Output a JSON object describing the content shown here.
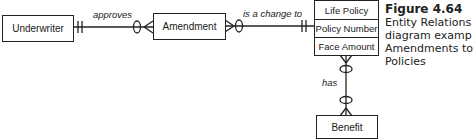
{
  "entities": {
    "underwriter": "Underwriter",
    "amendment": "Amendment",
    "life_policy": {
      "rows": [
        "Life Policy",
        "Policy Number",
        "Face Amount"
      ]
    },
    "benefit": "Benefit"
  },
  "relationships": {
    "approves": "approves",
    "is_a_change_to": "is a change to",
    "has": "has"
  },
  "caption": {
    "title": "Figure 4.64",
    "lines": [
      "Entity Relations",
      "diagram examp",
      "Amendments to",
      "Policies"
    ]
  }
}
